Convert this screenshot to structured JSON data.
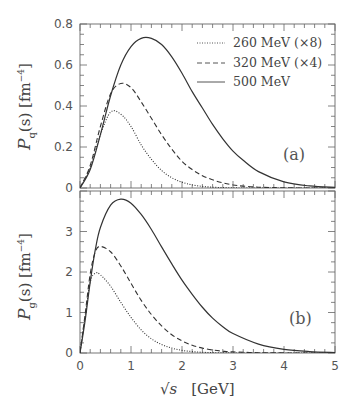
{
  "chart_data": [
    {
      "type": "line",
      "panel": "(a)",
      "title": "",
      "xlabel": "√s [GeV]",
      "ylabel": "P_q(s) [fm^-4]",
      "xlim": [
        0,
        5
      ],
      "ylim": [
        0,
        0.8
      ],
      "xticks": [
        "0",
        "1",
        "2",
        "3",
        "4",
        "5"
      ],
      "yticks": [
        "0",
        "0.2",
        "0.4",
        "0.6",
        "0.8"
      ],
      "grid": false,
      "legend_position": "upper right",
      "x": [
        0,
        0.2,
        0.4,
        0.6,
        0.8,
        1.0,
        1.2,
        1.4,
        1.6,
        1.8,
        2.0,
        2.2,
        2.4,
        2.6,
        2.8,
        3.0,
        3.2,
        3.5,
        4.0,
        4.5,
        5.0
      ],
      "series": [
        {
          "name": "260 MeV (×8)",
          "style": "dotted",
          "values": [
            0,
            0.1,
            0.26,
            0.37,
            0.36,
            0.3,
            0.21,
            0.14,
            0.085,
            0.05,
            0.028,
            0.015,
            0.008,
            0.004,
            0.002,
            0.001,
            0,
            0,
            0,
            0,
            0
          ]
        },
        {
          "name": "320 MeV (×4)",
          "style": "dashed",
          "values": [
            0,
            0.11,
            0.3,
            0.46,
            0.51,
            0.49,
            0.42,
            0.34,
            0.26,
            0.19,
            0.13,
            0.09,
            0.06,
            0.04,
            0.025,
            0.015,
            0.009,
            0.004,
            0.001,
            0,
            0
          ]
        },
        {
          "name": "500 MeV",
          "style": "solid",
          "values": [
            0,
            0.09,
            0.26,
            0.45,
            0.6,
            0.69,
            0.73,
            0.73,
            0.7,
            0.64,
            0.56,
            0.47,
            0.39,
            0.31,
            0.24,
            0.18,
            0.135,
            0.08,
            0.03,
            0.01,
            0.003
          ]
        }
      ],
      "annotations": [
        "(a)"
      ]
    },
    {
      "type": "line",
      "panel": "(b)",
      "title": "",
      "xlabel": "√s [GeV]",
      "ylabel": "P_g(s) [fm^-4]",
      "xlim": [
        0,
        5
      ],
      "ylim": [
        0,
        4
      ],
      "xticks": [
        "0",
        "1",
        "2",
        "3",
        "4",
        "5"
      ],
      "yticks": [
        "0",
        "1",
        "2",
        "3"
      ],
      "grid": false,
      "x": [
        0,
        0.1,
        0.2,
        0.3,
        0.4,
        0.6,
        0.8,
        1.0,
        1.2,
        1.4,
        1.6,
        1.8,
        2.0,
        2.2,
        2.4,
        2.6,
        2.8,
        3.0,
        3.5,
        4.0,
        4.5,
        5.0
      ],
      "series": [
        {
          "name": "260 MeV (×8)",
          "style": "dotted",
          "values": [
            0,
            0.9,
            1.75,
            1.97,
            1.93,
            1.65,
            1.25,
            0.88,
            0.57,
            0.35,
            0.21,
            0.12,
            0.065,
            0.035,
            0.018,
            0.009,
            0.004,
            0.002,
            0,
            0,
            0,
            0
          ]
        },
        {
          "name": "320 MeV (×4)",
          "style": "dashed",
          "values": [
            0,
            0.95,
            1.95,
            2.5,
            2.63,
            2.5,
            2.15,
            1.72,
            1.3,
            0.95,
            0.67,
            0.45,
            0.3,
            0.19,
            0.12,
            0.075,
            0.045,
            0.027,
            0.008,
            0.002,
            0,
            0
          ]
        },
        {
          "name": "500 MeV",
          "style": "solid",
          "values": [
            0,
            0.8,
            1.75,
            2.55,
            3.1,
            3.65,
            3.8,
            3.7,
            3.42,
            3.05,
            2.62,
            2.2,
            1.8,
            1.45,
            1.13,
            0.86,
            0.65,
            0.48,
            0.22,
            0.09,
            0.035,
            0.012
          ]
        }
      ],
      "annotations": [
        "(b)"
      ]
    }
  ],
  "labels": {
    "panel_a_ylabel_main": "P",
    "panel_a_ylabel_sub": "q",
    "panel_a_ylabel_rest": "(s)  [fm",
    "panel_b_ylabel_main": "P",
    "panel_b_ylabel_sub": "g",
    "panel_b_ylabel_rest": "(s)  [fm",
    "ylabel_exp": "−4",
    "ylabel_close": "]",
    "xlabel_sqrt": "√s",
    "xlabel_unit": "[GeV]",
    "tag_a": "(a)",
    "tag_b": "(b)",
    "legend": [
      "260 MeV (×8)",
      "320 MeV (×4)",
      "500 MeV"
    ]
  }
}
